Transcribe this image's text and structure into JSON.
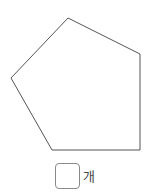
{
  "figure": {
    "shape": "pentagon",
    "stroke_color": "#555555",
    "points": "68,18 140,54 140,150 52,150 11,78"
  },
  "answer": {
    "value": "",
    "unit_label": "개"
  }
}
